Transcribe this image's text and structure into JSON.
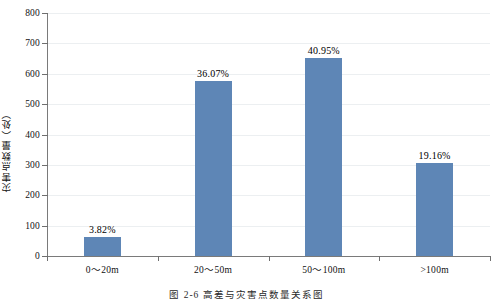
{
  "chart_data": {
    "type": "bar",
    "title": "",
    "categories": [
      "0～20m",
      "20～50m",
      "50～100m",
      ">100m"
    ],
    "values": [
      61,
      575,
      652,
      305
    ],
    "data_labels": [
      "3.82%",
      "36.07%",
      "40.95%",
      "19.16%"
    ],
    "xlabel": "",
    "ylabel": "灾害点数量（处）",
    "ylim": [
      0,
      800
    ],
    "ytick_values": [
      0,
      100,
      200,
      300,
      400,
      500,
      600,
      700,
      800
    ],
    "ytick_labels": [
      "0",
      "100",
      "200",
      "300",
      "400",
      "500",
      "600",
      "700",
      "800"
    ],
    "grid": true,
    "legend": false,
    "series_color": "#5e86b6",
    "caption": "图 2-6   高差与灾害点数量关系图"
  },
  "figure": {
    "caption": "图 2-6   高差与灾害点数量关系图",
    "y_axis_title": "灾害点数量（处）"
  }
}
